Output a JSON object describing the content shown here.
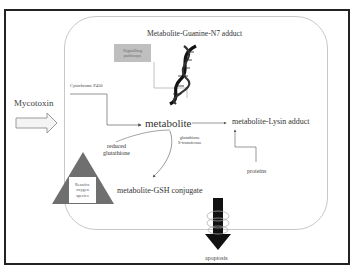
{
  "diagram": {
    "type": "mycotoxin metabolism pathway",
    "input": {
      "label": "Mycotoxin"
    },
    "enzymes": {
      "cyp": "Cytochrome P450",
      "gst_line1": "glutathione",
      "gst_line2": "S-transferase"
    },
    "nodes": {
      "metabolite": "metabolite",
      "guanine_adduct": "Metabolite-Guanine-N7 adduct",
      "lysin_adduct": "metabolite-Lysin adduct",
      "gsh_conjugate": "metabolite-GSH conjugate",
      "proteins": "proteins",
      "reduced_gsh_line1": "reduced",
      "reduced_gsh_line2": "glutathione",
      "signalling_line1": "Signalling",
      "signalling_line2": "pathways",
      "ros_line1": "Reactive",
      "ros_line2": "oxygen",
      "ros_line3": "species",
      "apoptosis": "apoptosis"
    },
    "icons": [
      "hollow-right-arrow-icon",
      "dna-helix-icon",
      "warning-triangle-icon",
      "black-down-arrow-icon",
      "membrane-channel-icon"
    ],
    "colors": {
      "frame": "#222222",
      "cell_border": "#c8c8c8",
      "signalling_box": "#bfbfbf",
      "triangle": "#6f6f6f",
      "arrow_dark": "#111111"
    }
  }
}
